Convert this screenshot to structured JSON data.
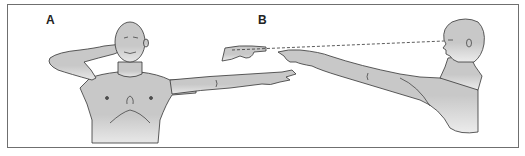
{
  "figure": {
    "panels": [
      {
        "label": "A",
        "description": "Finger-to-nose test: subject touches nose with one index finger, other arm extended pointing"
      },
      {
        "label": "B",
        "description": "Finger-to-finger test: subject in profile sighting along outstretched arm to examiner's finger"
      }
    ],
    "colors": {
      "skin_fill": "#c8c8c8",
      "outline": "#333333",
      "frame": "#6f6f6f",
      "background": "#ffffff"
    },
    "sight_line": "dashed line from eye to fingertips",
    "caption_text": ""
  }
}
